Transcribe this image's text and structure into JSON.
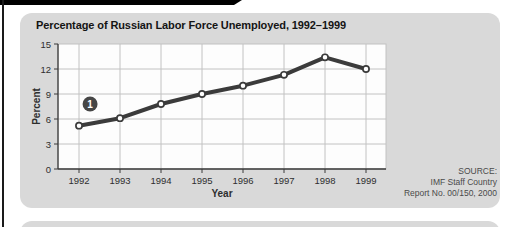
{
  "decor": {
    "top_bar_color": "#000000",
    "edge_line_color": "#1a1a1a",
    "card_color": "#d9d9d9"
  },
  "chart": {
    "title": "Percentage of Russian Labor Force Unemployed, 1992–1999",
    "xlabel": "Year",
    "ylabel": "Percent",
    "source_lines": [
      "SOURCE:",
      "IMF Staff Country",
      "Report No. 00/150, 2000"
    ]
  },
  "chart_data": {
    "type": "line",
    "title": "Percentage of Russian Labor Force Unemployed, 1992–1999",
    "xlabel": "Year",
    "ylabel": "Percent",
    "x": [
      1992,
      1993,
      1994,
      1995,
      1996,
      1997,
      1998,
      1999
    ],
    "values": [
      5.2,
      6.1,
      7.8,
      9.0,
      10.0,
      11.3,
      13.4,
      12.0
    ],
    "ylim": [
      0,
      15
    ],
    "y_ticks": [
      0,
      3,
      6,
      9,
      12,
      15
    ],
    "grid": true,
    "legend": "none",
    "line_color": "#3b3b3b",
    "grid_color": "#c2c2c2",
    "axis_color": "#3a3a3a",
    "marker": "open-circle",
    "annotations": [
      {
        "label": "1",
        "x": 1992.27,
        "y": 7.8
      }
    ]
  }
}
